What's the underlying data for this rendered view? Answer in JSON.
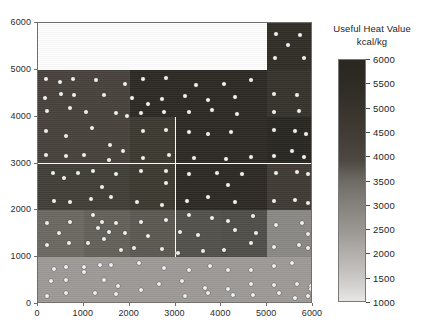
{
  "legend": {
    "title_line1": "Useful Heat Value",
    "title_line2": "kcal/kg",
    "ticks": [
      6000,
      5500,
      5000,
      4500,
      4000,
      3500,
      3000,
      2500,
      2000,
      1500,
      1000
    ],
    "min": 1000,
    "max": 6000,
    "low_color": "#e8e7e5",
    "high_color": "#2a2721"
  },
  "chart_data": {
    "type": "heatmap",
    "title": "",
    "xlabel": "",
    "ylabel": "",
    "xlim": [
      0,
      6000
    ],
    "ylim": [
      0,
      6000
    ],
    "xticks": [
      0,
      1000,
      2000,
      3000,
      4000,
      5000,
      6000
    ],
    "yticks": [
      0,
      1000,
      2000,
      3000,
      4000,
      5000,
      6000
    ],
    "grid": false,
    "legend_position": "right",
    "colorbar_label": "Useful Heat Value kcal/kg",
    "value_unit": "kcal/kg",
    "cells": [
      {
        "x0": 0,
        "x1": 5000,
        "y0": 5000,
        "y1": 6000,
        "value": null,
        "color": "#ffffff"
      },
      {
        "x0": 5000,
        "x1": 6000,
        "y0": 5000,
        "y1": 6000,
        "value": 5700,
        "color": "#2f2c26"
      },
      {
        "x0": 0,
        "x1": 2000,
        "y0": 4000,
        "y1": 5000,
        "value": 4450,
        "color": "#46423a"
      },
      {
        "x0": 2000,
        "x1": 5000,
        "y0": 4000,
        "y1": 5000,
        "value": 5600,
        "color": "#2b2822"
      },
      {
        "x0": 5000,
        "x1": 6000,
        "y0": 4000,
        "y1": 5000,
        "value": 5200,
        "color": "#35322b"
      },
      {
        "x0": 0,
        "x1": 2000,
        "y0": 3000,
        "y1": 4000,
        "value": 4450,
        "color": "#46423a"
      },
      {
        "x0": 2000,
        "x1": 3000,
        "y0": 3000,
        "y1": 4000,
        "value": 4900,
        "color": "#3b382f"
      },
      {
        "x0": 3000,
        "x1": 5000,
        "y0": 3000,
        "y1": 4000,
        "value": 5600,
        "color": "#2b2822"
      },
      {
        "x0": 5000,
        "x1": 6000,
        "y0": 3000,
        "y1": 4000,
        "value": 5800,
        "color": "#272520"
      },
      {
        "x0": 0,
        "x1": 2000,
        "y0": 2000,
        "y1": 3000,
        "value": 4650,
        "color": "#413d36"
      },
      {
        "x0": 2000,
        "x1": 3000,
        "y0": 2000,
        "y1": 3000,
        "value": 4900,
        "color": "#3b382f"
      },
      {
        "x0": 3000,
        "x1": 5000,
        "y0": 2000,
        "y1": 3000,
        "value": 5600,
        "color": "#2b2822"
      },
      {
        "x0": 5000,
        "x1": 6000,
        "y0": 2000,
        "y1": 3000,
        "value": 4800,
        "color": "#3e3a33"
      },
      {
        "x0": 0,
        "x1": 1000,
        "y0": 1000,
        "y1": 2000,
        "value": 3200,
        "color": "#6b6862"
      },
      {
        "x0": 1000,
        "x1": 2000,
        "y0": 1000,
        "y1": 2000,
        "value": 3350,
        "color": "#626059"
      },
      {
        "x0": 2000,
        "x1": 3000,
        "y0": 1000,
        "y1": 2000,
        "value": 3550,
        "color": "#5b5851"
      },
      {
        "x0": 3000,
        "x1": 4000,
        "y0": 1000,
        "y1": 2000,
        "value": 3800,
        "color": "#52504a"
      },
      {
        "x0": 4000,
        "x1": 5000,
        "y0": 1000,
        "y1": 2000,
        "value": 3900,
        "color": "#4f4d47"
      },
      {
        "x0": 5000,
        "x1": 6000,
        "y0": 1000,
        "y1": 2000,
        "value": 2700,
        "color": "#8b8884"
      },
      {
        "x0": 0,
        "x1": 6000,
        "y0": 0,
        "y1": 1000,
        "value": 2300,
        "color": "#9d9a97"
      }
    ],
    "points": [
      [
        180,
        4810
      ],
      [
        480,
        4730
      ],
      [
        760,
        4800
      ],
      [
        1270,
        4790
      ],
      [
        1900,
        4700
      ],
      [
        2300,
        4800
      ],
      [
        2800,
        4820
      ],
      [
        3450,
        4680
      ],
      [
        4050,
        4700
      ],
      [
        4650,
        4780
      ],
      [
        5200,
        5760
      ],
      [
        5720,
        5740
      ],
      [
        5450,
        5530
      ],
      [
        5180,
        5250
      ],
      [
        5800,
        5250
      ],
      [
        150,
        4400
      ],
      [
        500,
        4480
      ],
      [
        780,
        4460
      ],
      [
        1450,
        4460
      ],
      [
        2050,
        4400
      ],
      [
        2400,
        4280
      ],
      [
        2700,
        4380
      ],
      [
        3200,
        4440
      ],
      [
        3700,
        4350
      ],
      [
        4300,
        4430
      ],
      [
        5150,
        4480
      ],
      [
        5650,
        4460
      ],
      [
        200,
        4120
      ],
      [
        700,
        4180
      ],
      [
        1050,
        4110
      ],
      [
        1700,
        4080
      ],
      [
        1950,
        4020
      ],
      [
        2250,
        4080
      ],
      [
        2750,
        4100
      ],
      [
        3300,
        4090
      ],
      [
        3800,
        4150
      ],
      [
        4350,
        4060
      ],
      [
        5150,
        4090
      ],
      [
        5700,
        4120
      ],
      [
        170,
        3700
      ],
      [
        620,
        3580
      ],
      [
        1170,
        3750
      ],
      [
        1560,
        3400
      ],
      [
        1850,
        3260
      ],
      [
        2300,
        3700
      ],
      [
        2800,
        3720
      ],
      [
        3300,
        3670
      ],
      [
        3700,
        3620
      ],
      [
        4200,
        3680
      ],
      [
        5150,
        3720
      ],
      [
        5600,
        3700
      ],
      [
        5850,
        3640
      ],
      [
        180,
        3180
      ],
      [
        620,
        3160
      ],
      [
        1000,
        3180
      ],
      [
        1550,
        3080
      ],
      [
        2300,
        3120
      ],
      [
        2850,
        3180
      ],
      [
        3400,
        3110
      ],
      [
        4100,
        3090
      ],
      [
        4650,
        3140
      ],
      [
        5150,
        3160
      ],
      [
        5550,
        3260
      ],
      [
        5800,
        3140
      ],
      [
        330,
        2800
      ],
      [
        560,
        2700
      ],
      [
        870,
        2800
      ],
      [
        1200,
        2830
      ],
      [
        1700,
        2780
      ],
      [
        2250,
        2830
      ],
      [
        2800,
        2830
      ],
      [
        3300,
        2780
      ],
      [
        3900,
        2790
      ],
      [
        4450,
        2780
      ],
      [
        5200,
        2800
      ],
      [
        5650,
        2810
      ],
      [
        5900,
        2780
      ],
      [
        1400,
        2500
      ],
      [
        2800,
        2580
      ],
      [
        4150,
        2540
      ],
      [
        350,
        2200
      ],
      [
        700,
        2180
      ],
      [
        1150,
        2250
      ],
      [
        1600,
        2280
      ],
      [
        2150,
        2180
      ],
      [
        2700,
        2120
      ],
      [
        3250,
        2200
      ],
      [
        3700,
        2280
      ],
      [
        4300,
        2180
      ],
      [
        5150,
        2200
      ],
      [
        5600,
        2220
      ],
      [
        5880,
        2150
      ],
      [
        200,
        1740
      ],
      [
        700,
        1750
      ],
      [
        1200,
        1900
      ],
      [
        1400,
        1760
      ],
      [
        1700,
        1720
      ],
      [
        2250,
        1750
      ],
      [
        2800,
        1790
      ],
      [
        3300,
        1900
      ],
      [
        3800,
        1840
      ],
      [
        4150,
        1780
      ],
      [
        4700,
        1880
      ],
      [
        5200,
        1690
      ],
      [
        5750,
        1720
      ],
      [
        450,
        1510
      ],
      [
        1300,
        1620
      ],
      [
        1550,
        1540
      ],
      [
        1900,
        1520
      ],
      [
        2400,
        1460
      ],
      [
        3100,
        1530
      ],
      [
        3500,
        1470
      ],
      [
        4300,
        1580
      ],
      [
        4750,
        1510
      ],
      [
        5900,
        1500
      ],
      [
        200,
        1250
      ],
      [
        680,
        1300
      ],
      [
        1100,
        1310
      ],
      [
        1450,
        1380
      ],
      [
        1800,
        1150
      ],
      [
        2100,
        1190
      ],
      [
        2700,
        1180
      ],
      [
        3050,
        1090
      ],
      [
        3600,
        1130
      ],
      [
        4050,
        1150
      ],
      [
        4650,
        1300
      ],
      [
        5150,
        1220
      ],
      [
        5700,
        1250
      ],
      [
        5900,
        1190
      ],
      [
        350,
        750
      ],
      [
        600,
        800
      ],
      [
        1000,
        780
      ],
      [
        1350,
        840
      ],
      [
        1600,
        840
      ],
      [
        2200,
        880
      ],
      [
        2750,
        760
      ],
      [
        3300,
        720
      ],
      [
        3750,
        820
      ],
      [
        4150,
        720
      ],
      [
        4650,
        720
      ],
      [
        5150,
        820
      ],
      [
        5550,
        880
      ],
      [
        280,
        490
      ],
      [
        600,
        520
      ],
      [
        1000,
        690
      ],
      [
        1450,
        520
      ],
      [
        1750,
        380
      ],
      [
        2650,
        430
      ],
      [
        3150,
        500
      ],
      [
        3650,
        340
      ],
      [
        4150,
        330
      ],
      [
        4650,
        420
      ],
      [
        5150,
        400
      ],
      [
        5650,
        430
      ],
      [
        5950,
        380
      ],
      [
        200,
        180
      ],
      [
        620,
        230
      ],
      [
        1250,
        230
      ],
      [
        1700,
        220
      ],
      [
        2250,
        290
      ],
      [
        3200,
        180
      ],
      [
        3700,
        230
      ],
      [
        4250,
        190
      ],
      [
        4700,
        200
      ],
      [
        5250,
        230
      ],
      [
        5600,
        130
      ],
      [
        5900,
        170
      ],
      [
        5950,
        320
      ]
    ]
  }
}
